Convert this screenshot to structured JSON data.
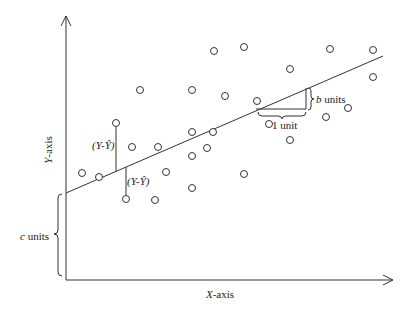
{
  "diagram": {
    "axes": {
      "x_label_var": "X",
      "x_label_rest": "-axis",
      "y_label_var": "Y",
      "y_label_rest": "-axis",
      "origin": [
        66,
        280
      ],
      "x_end": [
        393,
        280
      ],
      "y_end": [
        66,
        16
      ]
    },
    "regression_line": {
      "start": [
        66,
        193
      ],
      "end": [
        383,
        56
      ]
    },
    "annotations": {
      "residual_label_1": "(Y-Ŷ)",
      "residual_label_2": "(Y-Ŷ)",
      "slope_run": "1 unit",
      "slope_rise_var": "b",
      "slope_rise_rest": " units",
      "intercept_var": "c",
      "intercept_rest": " units"
    },
    "residuals": [
      {
        "point": [
          116,
          123
        ],
        "line_y": 172
      },
      {
        "point": [
          126,
          199
        ],
        "line_y": 167
      }
    ],
    "slope_triangle": {
      "x1": 250,
      "x2": 307,
      "y_base": 113
    },
    "points": [
      [
        140,
        90
      ],
      [
        192,
        90
      ],
      [
        116,
        123
      ],
      [
        192,
        132
      ],
      [
        225,
        96
      ],
      [
        244,
        47
      ],
      [
        214,
        51
      ],
      [
        330,
        49
      ],
      [
        373,
        50
      ],
      [
        290,
        69
      ],
      [
        373,
        77
      ],
      [
        132,
        147
      ],
      [
        158,
        147
      ],
      [
        192,
        156
      ],
      [
        213,
        132
      ],
      [
        257,
        101
      ],
      [
        269,
        124
      ],
      [
        82,
        173
      ],
      [
        99,
        177
      ],
      [
        166,
        172
      ],
      [
        207,
        148
      ],
      [
        192,
        188
      ],
      [
        126,
        199
      ],
      [
        155,
        200
      ],
      [
        290,
        140
      ],
      [
        244,
        174
      ],
      [
        326,
        117
      ],
      [
        348,
        108
      ]
    ],
    "colors": {
      "stroke": "#333333",
      "text": "#222222",
      "background": "#ffffff"
    }
  }
}
